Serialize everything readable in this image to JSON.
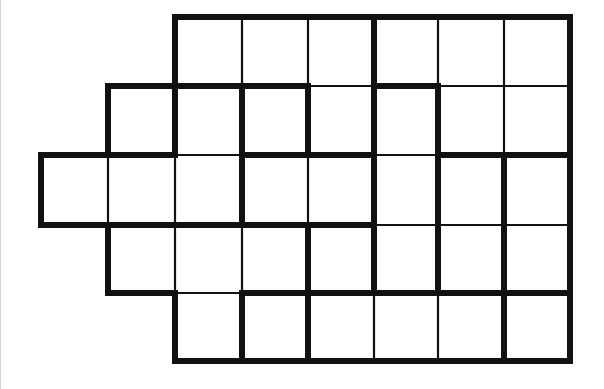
{
  "puzzle": {
    "type": "region-division grid",
    "colors": {
      "background": "#ffffff",
      "line": "#111111",
      "page_edge": "#d8d8d8"
    },
    "x_lines": [
      41,
      108,
      175,
      242,
      308,
      374,
      438,
      504,
      570
    ],
    "y_lines": [
      17,
      86,
      155,
      225,
      293,
      361
    ],
    "rows": [
      {
        "row": 0,
        "first_col": 2,
        "last_col": 7
      },
      {
        "row": 1,
        "first_col": 1,
        "last_col": 7
      },
      {
        "row": 2,
        "first_col": 0,
        "last_col": 7
      },
      {
        "row": 3,
        "first_col": 1,
        "last_col": 7
      },
      {
        "row": 4,
        "first_col": 2,
        "last_col": 7
      }
    ],
    "vertical_internal_edges": [
      {
        "row": 0,
        "x_index": 3,
        "thick": false
      },
      {
        "row": 0,
        "x_index": 4,
        "thick": false
      },
      {
        "row": 0,
        "x_index": 5,
        "thick": true
      },
      {
        "row": 0,
        "x_index": 6,
        "thick": false
      },
      {
        "row": 0,
        "x_index": 7,
        "thick": false
      },
      {
        "row": 1,
        "x_index": 2,
        "thick": true
      },
      {
        "row": 1,
        "x_index": 3,
        "thick": true
      },
      {
        "row": 1,
        "x_index": 4,
        "thick": true
      },
      {
        "row": 1,
        "x_index": 5,
        "thick": true
      },
      {
        "row": 1,
        "x_index": 6,
        "thick": true
      },
      {
        "row": 1,
        "x_index": 7,
        "thick": false
      },
      {
        "row": 2,
        "x_index": 1,
        "thick": false
      },
      {
        "row": 2,
        "x_index": 2,
        "thick": false
      },
      {
        "row": 2,
        "x_index": 3,
        "thick": true
      },
      {
        "row": 2,
        "x_index": 4,
        "thick": false
      },
      {
        "row": 2,
        "x_index": 5,
        "thick": true
      },
      {
        "row": 2,
        "x_index": 6,
        "thick": true
      },
      {
        "row": 2,
        "x_index": 7,
        "thick": true
      },
      {
        "row": 3,
        "x_index": 2,
        "thick": false
      },
      {
        "row": 3,
        "x_index": 3,
        "thick": false
      },
      {
        "row": 3,
        "x_index": 4,
        "thick": true
      },
      {
        "row": 3,
        "x_index": 5,
        "thick": true
      },
      {
        "row": 3,
        "x_index": 6,
        "thick": true
      },
      {
        "row": 3,
        "x_index": 7,
        "thick": true
      },
      {
        "row": 4,
        "x_index": 3,
        "thick": true
      },
      {
        "row": 4,
        "x_index": 4,
        "thick": true
      },
      {
        "row": 4,
        "x_index": 5,
        "thick": false
      },
      {
        "row": 4,
        "x_index": 6,
        "thick": false
      },
      {
        "row": 4,
        "x_index": 7,
        "thick": true
      }
    ],
    "horizontal_internal_edges": [
      {
        "y_index": 1,
        "col": 2,
        "thick": true
      },
      {
        "y_index": 1,
        "col": 3,
        "thick": true
      },
      {
        "y_index": 1,
        "col": 4,
        "thick": false
      },
      {
        "y_index": 1,
        "col": 5,
        "thick": true
      },
      {
        "y_index": 1,
        "col": 6,
        "thick": false
      },
      {
        "y_index": 1,
        "col": 7,
        "thick": false
      },
      {
        "y_index": 2,
        "col": 1,
        "thick": true
      },
      {
        "y_index": 2,
        "col": 2,
        "thick": false
      },
      {
        "y_index": 2,
        "col": 3,
        "thick": true
      },
      {
        "y_index": 2,
        "col": 4,
        "thick": true
      },
      {
        "y_index": 2,
        "col": 5,
        "thick": false
      },
      {
        "y_index": 2,
        "col": 6,
        "thick": true
      },
      {
        "y_index": 2,
        "col": 7,
        "thick": true
      },
      {
        "y_index": 3,
        "col": 1,
        "thick": true
      },
      {
        "y_index": 3,
        "col": 2,
        "thick": true
      },
      {
        "y_index": 3,
        "col": 3,
        "thick": true
      },
      {
        "y_index": 3,
        "col": 4,
        "thick": true
      },
      {
        "y_index": 3,
        "col": 5,
        "thick": false
      },
      {
        "y_index": 3,
        "col": 6,
        "thick": false
      },
      {
        "y_index": 3,
        "col": 7,
        "thick": false
      },
      {
        "y_index": 4,
        "col": 2,
        "thick": false
      },
      {
        "y_index": 4,
        "col": 3,
        "thick": true
      },
      {
        "y_index": 4,
        "col": 4,
        "thick": true
      },
      {
        "y_index": 4,
        "col": 5,
        "thick": true
      },
      {
        "y_index": 4,
        "col": 6,
        "thick": true
      },
      {
        "y_index": 4,
        "col": 7,
        "thick": true
      }
    ],
    "cell_count": 35,
    "cell_values": []
  }
}
